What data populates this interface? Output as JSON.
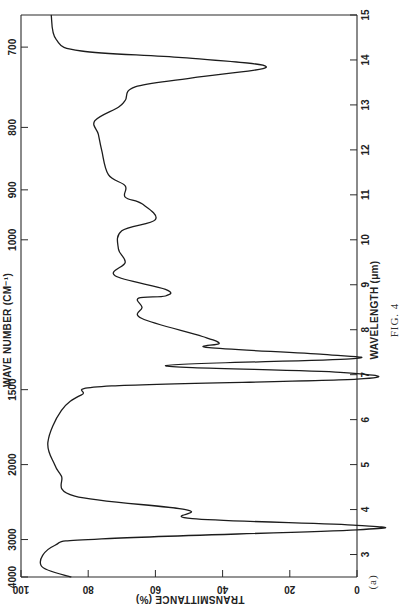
{
  "figure": {
    "caption": "FIG. 4",
    "panel_label": "(a)"
  },
  "chart_data": {
    "type": "line",
    "title": "",
    "orientation": "rotated-90 (wavelength axis vertical, transmittance axis horizontal)",
    "xlabel": "WAVELENGTH (μm)",
    "ylabel": "TRANSMITTANCE (%)",
    "secondary_xlabel": "WAVE NUMBER (CM⁻¹)",
    "xlim": [
      2.5,
      15
    ],
    "ylim": [
      0,
      100
    ],
    "grid": false,
    "legend": null,
    "wavelength_ticks": [
      3,
      4,
      5,
      6,
      7,
      8,
      9,
      10,
      11,
      12,
      13,
      14,
      15
    ],
    "wavenumber_ticks": [
      4000,
      3000,
      2000,
      1500,
      1000,
      900,
      800,
      700
    ],
    "transmittance_ticks": [
      100,
      80,
      60,
      40,
      20,
      0
    ],
    "series": [
      {
        "name": "IR spectrum (a)",
        "x": [
          15.0,
          14.45,
          14.2,
          14.05,
          13.85,
          13.6,
          13.4,
          13.1,
          12.95,
          12.65,
          12.35,
          12.0,
          11.45,
          11.2,
          10.95,
          10.8,
          10.45,
          10.2,
          9.8,
          9.5,
          9.2,
          8.9,
          8.75,
          8.7,
          8.5,
          8.25,
          7.85,
          7.7,
          7.6,
          7.45,
          7.35,
          7.2,
          7.05,
          6.9,
          6.75,
          6.55,
          6.2,
          5.5,
          5.0,
          4.75,
          4.3,
          4.0,
          3.8,
          3.65,
          3.55,
          3.35,
          3.2,
          2.75,
          2.5
        ],
        "values": [
          91,
          89.5,
          82,
          52,
          27,
          49,
          66,
          69,
          71,
          78,
          77,
          76,
          74,
          69,
          69,
          64,
          60,
          70,
          71,
          69,
          72,
          57,
          57,
          65,
          64,
          64,
          46,
          41,
          44,
          10,
          2,
          57,
          5,
          0,
          73,
          82,
          88,
          92,
          90,
          88,
          84,
          51,
          49,
          0,
          0,
          76,
          90,
          94,
          85
        ]
      }
    ],
    "annotations": [
      {
        "text": "FIG. 4",
        "position": "right margin"
      },
      {
        "text": "(a)",
        "position": "bottom right"
      }
    ]
  },
  "axes": {
    "wavelength": {
      "title": "WAVELENGTH (μm)",
      "labels": [
        "3",
        "4",
        "5",
        "6",
        "7",
        "8",
        "9",
        "10",
        "11",
        "12",
        "13",
        "14",
        "15"
      ]
    },
    "wavenumber": {
      "title": "WAVE NUMBER (CM⁻¹)",
      "labels": [
        "4000",
        "3000",
        "2000",
        "1500",
        "1000",
        "900",
        "800",
        "700"
      ]
    },
    "transmittance": {
      "title": "TRANSMITTANCE (%)",
      "labels": [
        "100",
        "80",
        "60",
        "40",
        "20",
        "0"
      ]
    }
  }
}
